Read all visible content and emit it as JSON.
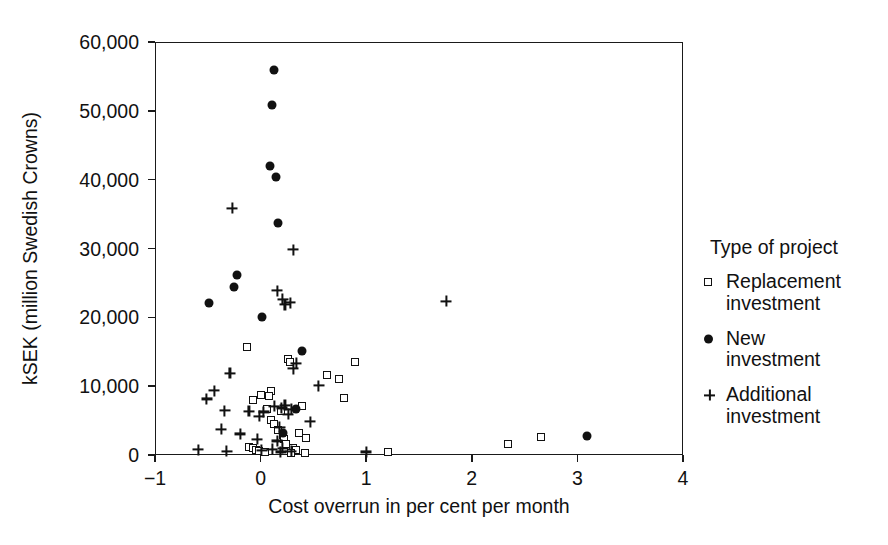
{
  "chart_data": {
    "type": "scatter",
    "title": "",
    "xlabel": "Cost overrun in per cent per month",
    "ylabel": "kSEK (million Swedish Crowns)",
    "xlim": [
      -1,
      4
    ],
    "ylim": [
      0,
      60000
    ],
    "xticks": [
      "−1",
      "0",
      "1",
      "2",
      "3",
      "4"
    ],
    "xtick_values": [
      -1,
      0,
      1,
      2,
      3,
      4
    ],
    "yticks": [
      "0",
      "10,000",
      "20,000",
      "30,000",
      "40,000",
      "50,000",
      "60,000"
    ],
    "ytick_values": [
      0,
      10000,
      20000,
      30000,
      40000,
      50000,
      60000
    ],
    "grid": false,
    "legend_position": "right",
    "series": [
      {
        "name": "Replacement investment",
        "marker": "open-square",
        "color": "#111111",
        "points": [
          [
            -0.14,
            15900
          ],
          [
            -0.01,
            8900
          ],
          [
            -0.08,
            8200
          ],
          [
            0.09,
            9400
          ],
          [
            0.07,
            8700
          ],
          [
            0.25,
            14100
          ],
          [
            0.27,
            13700
          ],
          [
            0.18,
            6600
          ],
          [
            0.09,
            5200
          ],
          [
            0.12,
            4700
          ],
          [
            0.16,
            3800
          ],
          [
            0.2,
            3100
          ],
          [
            0.21,
            2500
          ],
          [
            0.23,
            1800
          ],
          [
            0.3,
            1200
          ],
          [
            0.33,
            900
          ],
          [
            -0.12,
            1300
          ],
          [
            -0.08,
            1100
          ],
          [
            -0.05,
            900
          ],
          [
            -0.02,
            700
          ],
          [
            0.03,
            600
          ],
          [
            0.62,
            11800
          ],
          [
            0.73,
            11200
          ],
          [
            0.78,
            8400
          ],
          [
            0.88,
            13600
          ],
          [
            1.2,
            600
          ],
          [
            2.33,
            1700
          ],
          [
            2.65,
            2800
          ],
          [
            0.38,
            7200
          ],
          [
            0.35,
            3400
          ],
          [
            0.42,
            2600
          ],
          [
            0.05,
            6900
          ],
          [
            0.28,
            400
          ],
          [
            0.41,
            500
          ]
        ]
      },
      {
        "name": "New investment",
        "marker": "filled-circle",
        "color": "#111111",
        "points": [
          [
            0.12,
            56100
          ],
          [
            0.1,
            51000
          ],
          [
            0.08,
            42200
          ],
          [
            0.14,
            40500
          ],
          [
            0.16,
            33900
          ],
          [
            -0.23,
            26300
          ],
          [
            -0.26,
            24600
          ],
          [
            -0.5,
            22300
          ],
          [
            0.0,
            20200
          ],
          [
            0.38,
            15200
          ],
          [
            0.33,
            6800
          ],
          [
            0.2,
            3400
          ],
          [
            3.08,
            2900
          ]
        ]
      },
      {
        "name": "Additional investment",
        "marker": "plus",
        "color": "#111111",
        "points": [
          [
            -0.28,
            36000
          ],
          [
            0.3,
            30000
          ],
          [
            1.75,
            22500
          ],
          [
            0.15,
            24000
          ],
          [
            0.2,
            22800
          ],
          [
            0.27,
            22300
          ],
          [
            0.22,
            22000
          ],
          [
            -0.45,
            9500
          ],
          [
            -0.3,
            12000
          ],
          [
            0.33,
            13500
          ],
          [
            0.3,
            12700
          ],
          [
            0.54,
            10200
          ],
          [
            -0.52,
            8300
          ],
          [
            -0.35,
            6600
          ],
          [
            -0.12,
            6500
          ],
          [
            0.02,
            6400
          ],
          [
            0.12,
            7200
          ],
          [
            0.19,
            7000
          ],
          [
            0.22,
            7400
          ],
          [
            0.25,
            6100
          ],
          [
            0.28,
            6800
          ],
          [
            -0.02,
            5800
          ],
          [
            0.17,
            4200
          ],
          [
            0.46,
            5000
          ],
          [
            -0.38,
            3900
          ],
          [
            -0.2,
            3200
          ],
          [
            -0.04,
            2400
          ],
          [
            0.15,
            2200
          ],
          [
            0.2,
            1100
          ],
          [
            -0.6,
            900
          ],
          [
            -0.33,
            700
          ],
          [
            0.0,
            800
          ],
          [
            0.1,
            1000
          ],
          [
            0.18,
            600
          ],
          [
            0.28,
            700
          ],
          [
            0.99,
            600
          ]
        ]
      }
    ]
  },
  "legend": {
    "title": "Type of project",
    "entries": [
      {
        "marker": "open-square",
        "line1": "Replacement",
        "line2": "investment"
      },
      {
        "marker": "filled-circle",
        "line1": "New",
        "line2": "investment"
      },
      {
        "marker": "plus",
        "line1": "Additional",
        "line2": "investment"
      }
    ]
  }
}
